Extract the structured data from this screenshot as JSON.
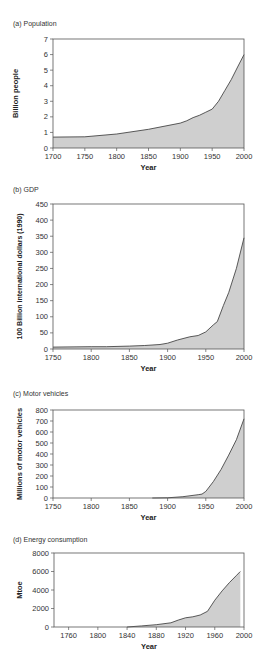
{
  "chart_data": [
    {
      "id": "a",
      "type": "area",
      "title": "(a) Population",
      "xlabel": "Year",
      "ylabel": "Billion people",
      "xlim": [
        1700,
        2000
      ],
      "ylim": [
        0,
        7
      ],
      "xticks": [
        1700,
        1750,
        1800,
        1850,
        1900,
        1950,
        2000
      ],
      "yticks": [
        0,
        1,
        2,
        3,
        4,
        5,
        6,
        7
      ],
      "grid": false,
      "x": [
        1700,
        1750,
        1800,
        1850,
        1900,
        1910,
        1920,
        1930,
        1940,
        1950,
        1960,
        1970,
        1980,
        1990,
        2000
      ],
      "values": [
        0.7,
        0.72,
        0.9,
        1.2,
        1.6,
        1.75,
        1.95,
        2.1,
        2.3,
        2.5,
        3.0,
        3.7,
        4.4,
        5.2,
        6.0
      ]
    },
    {
      "id": "b",
      "type": "area",
      "title": "(b) GDP",
      "xlabel": "Year",
      "ylabel": "100 Billion international dollars (1990)",
      "xlim": [
        1750,
        2000
      ],
      "ylim": [
        0,
        450
      ],
      "xticks": [
        1750,
        1800,
        1850,
        1900,
        1950,
        2000
      ],
      "yticks": [
        0,
        50,
        100,
        150,
        200,
        250,
        300,
        350,
        400,
        450
      ],
      "grid": false,
      "x": [
        1750,
        1800,
        1820,
        1850,
        1870,
        1890,
        1900,
        1913,
        1929,
        1940,
        1950,
        1960,
        1965,
        1973,
        1980,
        1990,
        2000
      ],
      "values": [
        6,
        7,
        7,
        9,
        11,
        14,
        18,
        28,
        38,
        42,
        53,
        75,
        85,
        135,
        175,
        250,
        345
      ]
    },
    {
      "id": "c",
      "type": "area",
      "title": "(c) Motor vehicles",
      "xlabel": "Year",
      "ylabel": "Millions of motor vehicles",
      "xlim": [
        1750,
        2000
      ],
      "ylim": [
        0,
        800
      ],
      "xticks": [
        1750,
        1800,
        1850,
        1900,
        1950,
        2000
      ],
      "yticks": [
        0,
        100,
        200,
        300,
        400,
        500,
        600,
        700,
        800
      ],
      "grid": false,
      "x": [
        1880,
        1900,
        1920,
        1940,
        1945,
        1950,
        1960,
        1970,
        1980,
        1990,
        2000
      ],
      "values": [
        0,
        2,
        12,
        30,
        35,
        60,
        150,
        260,
        390,
        530,
        720
      ]
    },
    {
      "id": "d",
      "type": "area",
      "title": "(d) Energy consumption",
      "xlabel": "Year",
      "ylabel": "Mtoe",
      "xlim": [
        1740,
        2000
      ],
      "ylim": [
        0,
        8000
      ],
      "xticks": [
        1760,
        1800,
        1840,
        1880,
        1920,
        1960,
        2000
      ],
      "yticks": [
        0,
        2000,
        4000,
        6000,
        8000
      ],
      "grid": false,
      "x": [
        1840,
        1860,
        1880,
        1900,
        1910,
        1920,
        1930,
        1940,
        1950,
        1960,
        1970,
        1980,
        1990,
        1995
      ],
      "values": [
        0,
        120,
        250,
        450,
        750,
        1000,
        1100,
        1300,
        1700,
        2900,
        3900,
        4800,
        5600,
        6000
      ]
    }
  ],
  "style": {
    "fill_color": "#cfcfcf",
    "line_color": "#333333",
    "axis_color": "#555555"
  }
}
